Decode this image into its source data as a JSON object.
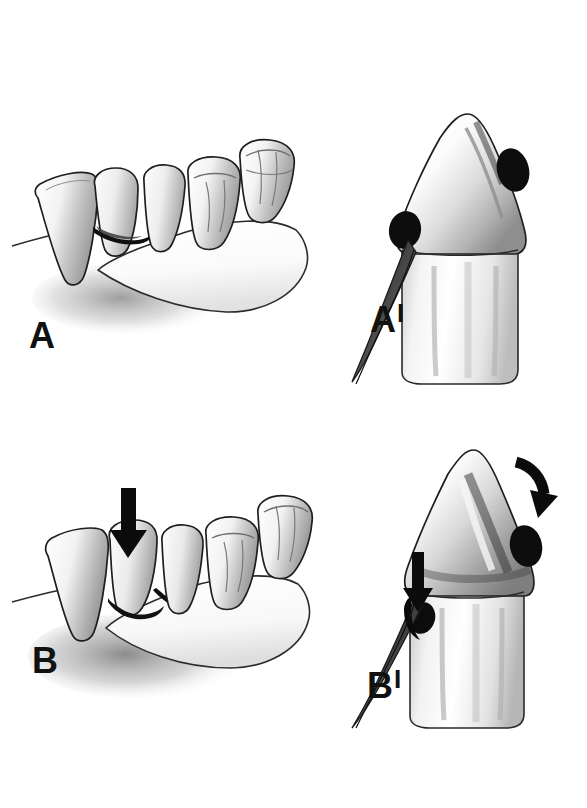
{
  "figure": {
    "background_color": "#ffffff",
    "ink_color": "#111111",
    "style": "grayscale airbrush medical illustration",
    "cut_off_header_text": "",
    "panel_count": 4
  },
  "labels": {
    "a": {
      "letter": "A",
      "prime": ""
    },
    "a_prime": {
      "letter": "A",
      "prime": "I"
    },
    "b": {
      "letter": "B",
      "prime": ""
    },
    "b_prime": {
      "letter": "B",
      "prime": "I"
    }
  },
  "panels": [
    {
      "id": "panel-a",
      "label": "A",
      "view": "buccal view of mandibular posterior segment",
      "description": "Lateral view of a mandibular arch segment showing canine, two premolars and two molars seated on the alveolar ridge, with a dark interproximal gingival defect between the canine and first premolar.",
      "has_force_arrow": false,
      "teeth": [
        "canine",
        "first premolar",
        "second premolar",
        "first molar",
        "second molar"
      ],
      "features": [
        "alveolar ridge",
        "interproximal dark defect",
        "cast shadow"
      ]
    },
    {
      "id": "panel-a-prime",
      "label": "A'",
      "view": "proximal cross-section of single tooth",
      "description": "Close-up proximal section of one tooth crown and root showing two dark calculus deposits at the cervical region and a dark gingival tissue flap sweeping down and to the left.",
      "has_force_arrow": false,
      "features": [
        "crown",
        "cervical line",
        "root",
        "calculus deposit left",
        "calculus deposit right",
        "gingival flap"
      ]
    },
    {
      "id": "panel-b",
      "label": "B",
      "view": "buccal view of mandibular posterior segment under occlusal load",
      "description": "Same mandibular segment as A, but a heavy vertical arrow presses down on the first premolar, the tooth is tipped and the gingival defect and ridge resorption beneath it are enlarged.",
      "has_force_arrow": true,
      "teeth": [
        "canine",
        "first premolar",
        "second premolar",
        "first molar",
        "second molar"
      ],
      "features": [
        "occlusal force arrow",
        "tipped premolar",
        "deepened gingival defect",
        "alveolar resorption shadow"
      ]
    },
    {
      "id": "panel-b-prime",
      "label": "B'",
      "view": "proximal cross-section of single tooth under occlusal load",
      "description": "Close-up proximal section as in A', now with a vertical arrow driving into the gingival sulcus on the left and a curved arrow at the upper right indicating lateral tooth displacement; the pocket is deeper and the calculus is carried apically.",
      "has_force_arrow": true,
      "features": [
        "vertical pocket arrow",
        "curved displacement arrow",
        "deepened periodontal pocket",
        "calculus deposit",
        "gingival flap"
      ]
    }
  ],
  "annotations": {
    "arrows": [
      {
        "name": "occlusal-force-arrow-b",
        "panel": "B",
        "direction": "down",
        "style": "solid black block arrow"
      },
      {
        "name": "pocket-force-arrow-b-prime",
        "panel": "B'",
        "direction": "down",
        "style": "solid black block arrow"
      },
      {
        "name": "displacement-arrow-b-prime",
        "panel": "B'",
        "direction": "curved down-right",
        "style": "solid black curved arrow"
      }
    ]
  }
}
